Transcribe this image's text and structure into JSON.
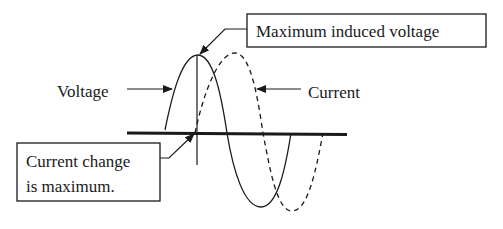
{
  "diagram": {
    "type": "phase-relationship",
    "labels": {
      "voltage": "Voltage",
      "current": "Current",
      "max_induced_voltage": "Maximum induced voltage",
      "current_change_line1": "Current change",
      "current_change_line2": "is maximum."
    },
    "curves": [
      {
        "name": "Voltage",
        "style": "solid"
      },
      {
        "name": "Current",
        "style": "dashed"
      }
    ],
    "colors": {
      "ink": "#1a1a1a",
      "background": "#ffffff"
    }
  }
}
